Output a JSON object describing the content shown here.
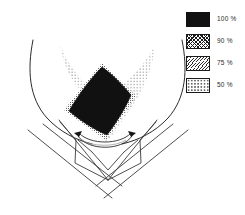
{
  "figure": {
    "background_color": "#ffffff",
    "line_color": "#2b2b2b"
  },
  "legend": {
    "position": "top-right",
    "items": [
      {
        "label": "100 %",
        "value": 100,
        "pattern": "solid-black",
        "color": "#111111",
        "swatch_name": "swatch-100"
      },
      {
        "label": "90 %",
        "value": 90,
        "pattern": "cross-hatch",
        "color": "#1c1c1c",
        "swatch_name": "swatch-90"
      },
      {
        "label": "75 %",
        "value": 75,
        "pattern": "diagonal-hatch",
        "color": "#2a2a2a",
        "swatch_name": "swatch-75"
      },
      {
        "label": "50 %",
        "value": 50,
        "pattern": "sparse-stipple",
        "color": "#2a2a2a",
        "swatch_name": "swatch-50"
      }
    ]
  },
  "diagram": {
    "regions": [
      {
        "name": "dose-region-50",
        "label": "50 %",
        "pattern": "sparse-stipple",
        "shape": "butterfly-v"
      },
      {
        "name": "dose-region-100",
        "label": "100 %",
        "pattern": "solid-black",
        "shape": "diamond"
      }
    ],
    "anatomy": [
      {
        "name": "body-contour-left",
        "shape": "curve"
      },
      {
        "name": "body-contour-right",
        "shape": "curve"
      },
      {
        "name": "target-lens",
        "shape": "ellipse-lens"
      }
    ],
    "beams": [
      {
        "name": "beam-upper-left",
        "direction": "down-right"
      },
      {
        "name": "beam-upper-right",
        "direction": "down-left"
      },
      {
        "name": "beam-lower-left",
        "direction": "down-right"
      },
      {
        "name": "beam-lower-right",
        "direction": "down-left"
      }
    ],
    "markers": [
      {
        "name": "arrow-left",
        "direction": "right"
      },
      {
        "name": "arrow-right",
        "direction": "left"
      }
    ]
  }
}
